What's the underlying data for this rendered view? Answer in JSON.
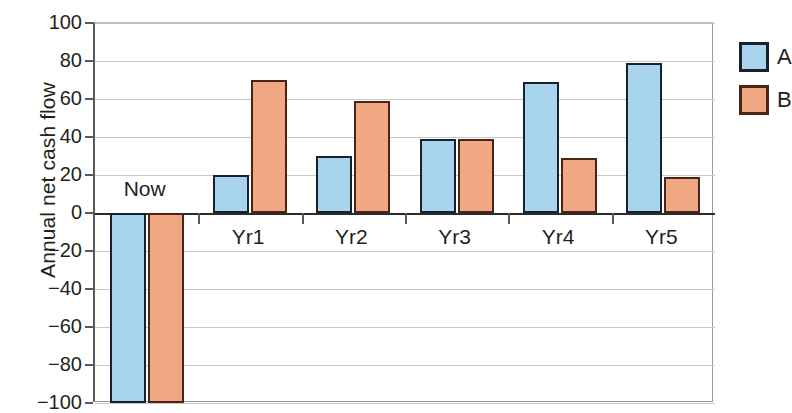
{
  "chart_data": {
    "type": "bar",
    "title": "",
    "xlabel": "",
    "ylabel": "Annual net cash flow",
    "categories": [
      "Now",
      "Yr1",
      "Yr2",
      "Yr3",
      "Yr4",
      "Yr5"
    ],
    "series": [
      {
        "name": "A",
        "color": "#a8d4ee",
        "values": [
          -100,
          20,
          30,
          39,
          69,
          79
        ]
      },
      {
        "name": "B",
        "color": "#f0a883",
        "values": [
          -100,
          70,
          59,
          39,
          29,
          19
        ]
      }
    ],
    "ylim": [
      -100,
      100
    ],
    "ytick_values": [
      100,
      80,
      60,
      40,
      20,
      0,
      -20,
      -40,
      -60,
      -80,
      -100
    ],
    "ytick_labels": [
      "100",
      "80",
      "60",
      "40",
      "20",
      "0",
      "−20",
      "−40",
      "−60",
      "−80",
      "−100"
    ],
    "grid": true,
    "legend_position": "right",
    "legend": [
      {
        "label": "A",
        "color": "#a8d4ee"
      },
      {
        "label": "B",
        "color": "#f0a883"
      }
    ]
  },
  "axis": {
    "y_title": "Annual net cash flow"
  }
}
